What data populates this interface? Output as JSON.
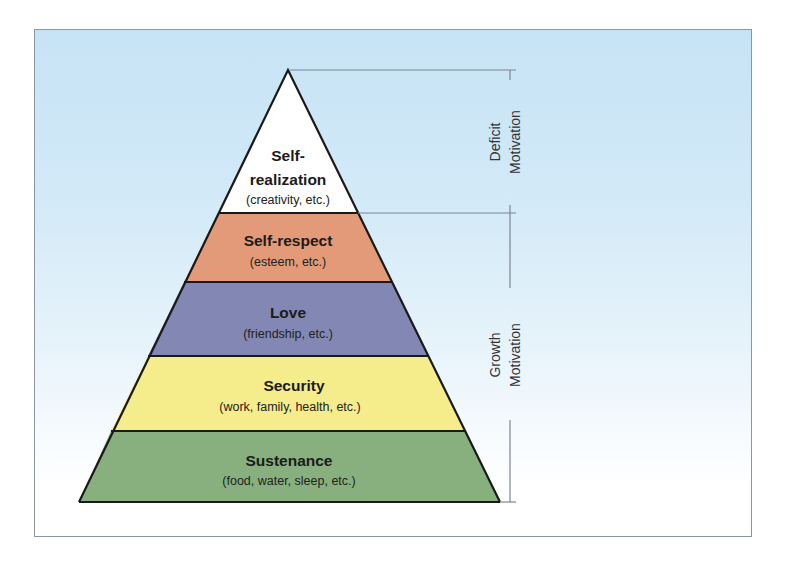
{
  "diagram": {
    "type": "pyramid",
    "colors": {
      "background_top": "#c6e3f5",
      "background_bottom": "#ffffff",
      "frame_border": "#8c96a3",
      "outline": "#1a1a1a",
      "bracket": "#7d8590"
    },
    "levels": [
      {
        "id": "self-realization",
        "title_line1": "Self-",
        "title_line2": "realization",
        "subtitle": "(creativity, etc.)",
        "color": "#ffffff"
      },
      {
        "id": "self-respect",
        "title": "Self-respect",
        "subtitle": "(esteem, etc.)",
        "color": "#e39a78"
      },
      {
        "id": "love",
        "title": "Love",
        "subtitle": "(friendship, etc.)",
        "color": "#8387b3"
      },
      {
        "id": "security",
        "title": "Security",
        "subtitle": "(work, family, health, etc.)",
        "color": "#f5ec8c"
      },
      {
        "id": "sustenance",
        "title": "Sustenance",
        "subtitle": "(food, water, sleep, etc.)",
        "color": "#87b07e"
      }
    ],
    "brackets": [
      {
        "id": "deficit",
        "line1": "Deficit",
        "line2": "Motivation"
      },
      {
        "id": "growth",
        "line1": "Growth",
        "line2": "Motivation"
      }
    ]
  }
}
